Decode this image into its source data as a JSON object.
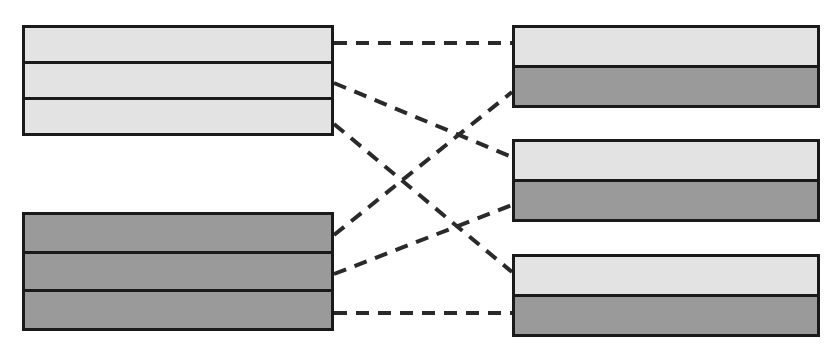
{
  "diagram": {
    "type": "block-mapping",
    "canvas": {
      "width": 833,
      "height": 355,
      "background": "#ffffff"
    },
    "colors": {
      "light_fill": "#e3e3e3",
      "dark_fill": "#9a9a9a",
      "outline": "#1a1a1a",
      "link_stroke": "#2a2a2a"
    },
    "left_blocks": [
      {
        "id": "left-top",
        "name": "left-block-top",
        "x": 22,
        "y": 25,
        "width": 312,
        "height": 111,
        "rows": [
          {
            "id": "lt-r1",
            "fill": "light",
            "label": ""
          },
          {
            "id": "lt-r2",
            "fill": "light",
            "label": ""
          },
          {
            "id": "lt-r3",
            "fill": "light",
            "label": ""
          }
        ]
      },
      {
        "id": "left-bottom",
        "name": "left-block-bottom",
        "x": 22,
        "y": 212,
        "width": 312,
        "height": 119,
        "rows": [
          {
            "id": "lb-r1",
            "fill": "dark",
            "label": ""
          },
          {
            "id": "lb-r2",
            "fill": "dark",
            "label": ""
          },
          {
            "id": "lb-r3",
            "fill": "dark",
            "label": ""
          }
        ]
      }
    ],
    "right_blocks": [
      {
        "id": "right-top",
        "name": "right-block-top",
        "x": 512,
        "y": 25,
        "width": 308,
        "height": 83,
        "rows": [
          {
            "id": "rt-r1",
            "fill": "light",
            "label": ""
          },
          {
            "id": "rt-r2",
            "fill": "dark",
            "label": ""
          }
        ]
      },
      {
        "id": "right-middle",
        "name": "right-block-middle",
        "x": 512,
        "y": 139,
        "width": 308,
        "height": 83,
        "rows": [
          {
            "id": "rm-r1",
            "fill": "light",
            "label": ""
          },
          {
            "id": "rm-r2",
            "fill": "dark",
            "label": ""
          }
        ]
      },
      {
        "id": "right-bottom",
        "name": "right-block-bottom",
        "x": 512,
        "y": 254,
        "width": 308,
        "height": 83,
        "rows": [
          {
            "id": "rb-r1",
            "fill": "light",
            "label": ""
          },
          {
            "id": "rb-r2",
            "fill": "dark",
            "label": ""
          }
        ]
      }
    ],
    "links": [
      {
        "id": "link-1",
        "from": "lt-r1",
        "to": "rt-r1",
        "x1": 334,
        "y1": 43,
        "x2": 512,
        "y2": 43,
        "style": "dashed"
      },
      {
        "id": "link-2",
        "from": "lt-r2",
        "to": "rm-r1",
        "x1": 334,
        "y1": 83,
        "x2": 512,
        "y2": 157,
        "style": "dashed"
      },
      {
        "id": "link-3",
        "from": "lt-r3",
        "to": "rb-r1",
        "x1": 334,
        "y1": 124,
        "x2": 512,
        "y2": 272,
        "style": "dashed"
      },
      {
        "id": "link-4",
        "from": "lb-r1",
        "to": "rt-r2",
        "x1": 334,
        "y1": 235,
        "x2": 512,
        "y2": 92,
        "style": "dashed"
      },
      {
        "id": "link-5",
        "from": "lb-r2",
        "to": "rm-r2",
        "x1": 334,
        "y1": 274,
        "x2": 512,
        "y2": 205,
        "style": "dashed"
      },
      {
        "id": "link-6",
        "from": "lb-r3",
        "to": "rb-r2",
        "x1": 334,
        "y1": 313,
        "x2": 512,
        "y2": 313,
        "style": "dashed"
      }
    ]
  }
}
